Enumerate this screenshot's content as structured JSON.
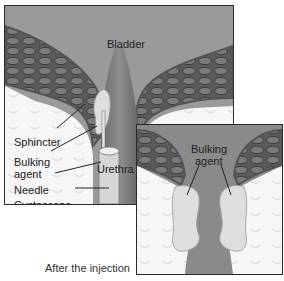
{
  "main_panel": {
    "labels": {
      "bladder": "Bladder",
      "sphincter": "Sphincter",
      "bulking_agent_line1": "Bulking",
      "bulking_agent_line2": "agent",
      "urethra": "Urethra",
      "needle": "Needle",
      "cystoscope": "Cystoscope"
    }
  },
  "inset_panel": {
    "labels": {
      "bulking_agent_line1": "Bulking",
      "bulking_agent_line2": "agent"
    },
    "caption": "After the injection"
  },
  "colors": {
    "tissue_dark": "#6e6e6e",
    "tissue_mid": "#8c8c8c",
    "bladder_bg": "#9a9a9a",
    "muscle": "#4a4a4a",
    "bulking_agent": "#dcdcdc",
    "background": "#f4f4f4"
  }
}
